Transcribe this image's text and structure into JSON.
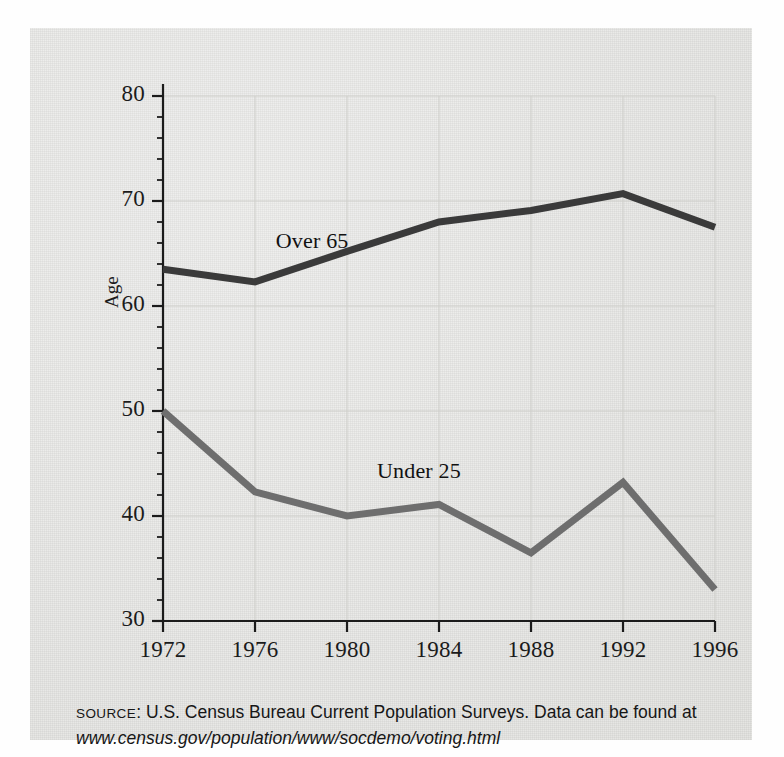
{
  "figure": {
    "y_axis_title": "Age",
    "series_labels": {
      "over65": "Over 65",
      "under25": "Under 25"
    }
  },
  "caption": {
    "source_word": "SOURCE",
    "colon_text": ": U.S. Census Bureau Current Population Surveys. Data can be found at ",
    "url": "www.census.gov/population/www/socdemo/voting.html"
  },
  "colors": {
    "panel_background": "#e9e9e7",
    "over65_line": "#3a3a3a",
    "under25_line": "#6e6e6e",
    "axis": "#1b1b1b",
    "gridline": "#cfcfcb",
    "text": "#161616"
  },
  "chart_data": {
    "type": "line",
    "title": "",
    "xlabel": "",
    "ylabel": "Age",
    "x": [
      1972,
      1976,
      1980,
      1984,
      1988,
      1992,
      1996
    ],
    "xtick_labels": [
      "1972",
      "1976",
      "1980",
      "1984",
      "1988",
      "1992",
      "1996"
    ],
    "ytick_labels": [
      "30",
      "40",
      "50",
      "60",
      "70",
      "80"
    ],
    "yticks": [
      30,
      40,
      50,
      60,
      70,
      80
    ],
    "yminor_tick_step": 2,
    "ylim": [
      30,
      80
    ],
    "xlim": [
      1972,
      1996
    ],
    "grid": true,
    "grid_axes": "both",
    "legend": "inline-labels",
    "series": [
      {
        "name": "Over 65",
        "color": "#3a3a3a",
        "values": [
          63.5,
          62.3,
          65.2,
          68.0,
          69.1,
          70.7,
          67.5
        ]
      },
      {
        "name": "Under 25",
        "color": "#6e6e6e",
        "values": [
          50.0,
          42.3,
          40.0,
          41.1,
          36.5,
          43.2,
          33.0
        ]
      }
    ],
    "annotations": [
      {
        "text": "Over 65",
        "x": 1976.9,
        "y": 65.9
      },
      {
        "text": "Under 25",
        "x": 1981.3,
        "y": 44.0
      }
    ]
  }
}
